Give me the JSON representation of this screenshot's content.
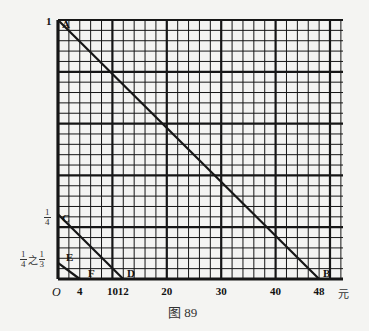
{
  "figure": {
    "caption": "图 89",
    "grid": {
      "x0": 58,
      "y0": 279,
      "right": 343,
      "top": 20,
      "px_per_unit_x": 5.44,
      "thin_step_x_units": 2,
      "thick_step_x_units": 10,
      "y_thin_cells": 25,
      "y_thick_every": 5
    },
    "y_axis": {
      "tick_one": "1",
      "label_quarter": {
        "num": "1",
        "den": "4"
      },
      "label_range": {
        "a_num": "1",
        "a_den": "4",
        "connector": "之",
        "b_num": "1",
        "b_den": "3"
      }
    },
    "x_axis": {
      "origin": "O",
      "unit": "元",
      "ticks": [
        {
          "value": 4,
          "label": "4"
        },
        {
          "value": 10,
          "label": "10"
        },
        {
          "value": 12,
          "label": "12"
        },
        {
          "value": 20,
          "label": "20"
        },
        {
          "value": 30,
          "label": "30"
        },
        {
          "value": 40,
          "label": "40"
        },
        {
          "value": 48,
          "label": "48"
        }
      ]
    },
    "points": {
      "A": {
        "label": "A",
        "x": 0,
        "y": 1
      },
      "B": {
        "label": "B",
        "x": 48,
        "y": 0
      },
      "C": {
        "label": "C",
        "x": 0,
        "y": 0.25
      },
      "D": {
        "label": "D",
        "x": 12,
        "y": 0
      },
      "E": {
        "label": "E",
        "x": 0,
        "y": 0.0625
      },
      "F": {
        "label": "F",
        "x": 4,
        "y": 0
      }
    },
    "segments": [
      {
        "from": "A",
        "to": "B"
      },
      {
        "from": "C",
        "to": "D"
      },
      {
        "from": "E",
        "to": "F"
      }
    ]
  }
}
